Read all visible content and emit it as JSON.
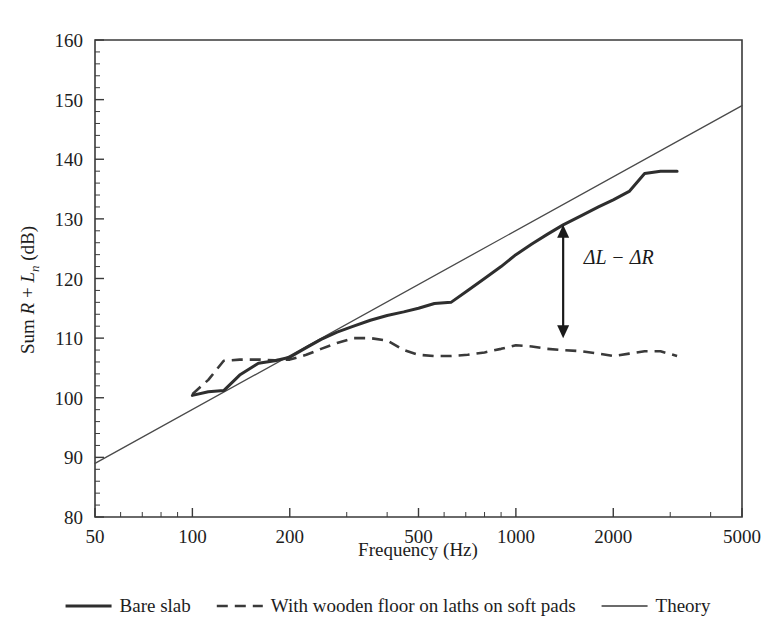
{
  "chart_data": {
    "type": "line",
    "title": "",
    "xlabel": "Frequency (Hz)",
    "ylabel": "Sum R + Ln (dB)",
    "ylabel_parts": {
      "prefix": "Sum ",
      "sym_r": "R",
      "plus": " + ",
      "sym_l": "L",
      "sub_n": "n",
      "unit": " (dB)"
    },
    "xscale": "log",
    "yscale": "linear",
    "xlim": [
      50,
      5000
    ],
    "ylim": [
      80,
      160
    ],
    "grid": false,
    "xticks": [
      50,
      100,
      200,
      500,
      1000,
      2000,
      5000
    ],
    "xtick_labels": [
      "50",
      "100",
      "200",
      "500",
      "1000",
      "2000",
      "5000"
    ],
    "yticks": [
      80,
      90,
      100,
      110,
      120,
      130,
      140,
      150,
      160
    ],
    "ytick_labels": [
      "80",
      "90",
      "100",
      "110",
      "120",
      "130",
      "140",
      "150",
      "160"
    ],
    "yminor_step": 2,
    "legend_position": "below-plot",
    "annotations": [
      {
        "name": "delta-l-minus-delta-r",
        "text": "ΔL − ΔR",
        "x": 1400,
        "y_top": 129.0,
        "y_bottom": 110.0,
        "label_x": 1620,
        "label_y": 122.5,
        "arrow": "double-headed-vertical"
      }
    ],
    "series": [
      {
        "name": "Bare slab",
        "style": "solid-thick",
        "color": "#2e2e2e",
        "x": [
          100,
          112,
          125,
          140,
          160,
          180,
          200,
          225,
          250,
          280,
          315,
          355,
          400,
          450,
          500,
          560,
          630,
          710,
          800,
          900,
          1000,
          1120,
          1250,
          1400,
          1600,
          1800,
          2000,
          2240,
          2500,
          2800,
          3150
        ],
        "y": [
          100.4,
          101.0,
          101.2,
          103.8,
          105.8,
          106.2,
          106.8,
          108.4,
          109.8,
          111.0,
          112.0,
          113.0,
          113.8,
          114.4,
          115.0,
          115.8,
          116.0,
          118.0,
          120.0,
          122.0,
          124.0,
          125.8,
          127.4,
          129.0,
          130.6,
          132.0,
          133.2,
          134.6,
          137.6,
          138.0,
          138.0
        ]
      },
      {
        "name": "With wooden floor on laths on soft pads",
        "style": "dashed",
        "color": "#3a3a3a",
        "x": [
          100,
          112,
          125,
          140,
          160,
          180,
          200,
          225,
          250,
          280,
          315,
          355,
          400,
          450,
          500,
          560,
          630,
          710,
          800,
          900,
          1000,
          1120,
          1250,
          1400,
          1600,
          1800,
          2000,
          2240,
          2500,
          2800,
          3150
        ],
        "y": [
          100.6,
          103.0,
          106.2,
          106.4,
          106.4,
          106.3,
          106.4,
          107.2,
          108.2,
          109.2,
          110.0,
          110.0,
          109.6,
          108.0,
          107.2,
          107.0,
          107.0,
          107.2,
          107.6,
          108.2,
          108.8,
          108.6,
          108.2,
          108.0,
          107.8,
          107.4,
          107.0,
          107.4,
          107.8,
          107.8,
          107.0
        ]
      },
      {
        "name": "Theory",
        "style": "solid-thin",
        "color": "#4a4a4a",
        "x": [
          50,
          5000
        ],
        "y": [
          89.0,
          149.0
        ]
      }
    ]
  },
  "legend": {
    "items": [
      {
        "label": "Bare slab",
        "style": "solid-thick",
        "swatch": "line-solid-thick-icon"
      },
      {
        "label": "With wooden floor on laths on soft pads",
        "style": "dashed",
        "swatch": "line-dashed-icon"
      },
      {
        "label": "Theory",
        "style": "solid-thin",
        "swatch": "line-solid-thin-icon"
      }
    ]
  },
  "colors": {
    "axis": "#3a3a3a",
    "bare_slab": "#2e2e2e",
    "wooden_floor": "#3a3a3a",
    "theory": "#4a4a4a",
    "text": "#1d1d1d",
    "background": "#ffffff"
  }
}
